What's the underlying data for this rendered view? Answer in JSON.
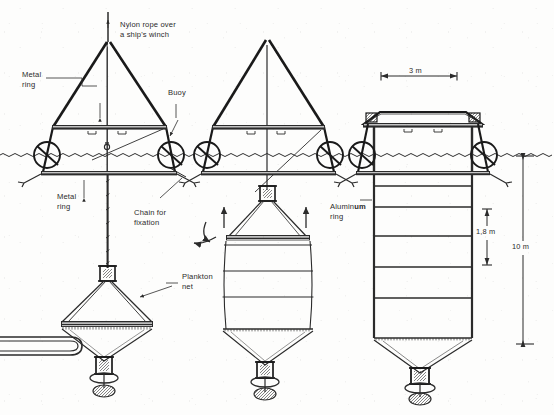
{
  "figure": {
    "type": "technical-line-diagram",
    "background_color": "#fdfdfc",
    "ink_color": "#1a1a1a",
    "panel_count": 3
  },
  "labels": {
    "nylon_rope": "Nylon rope over\na ship's winch",
    "metal_ring_top": "Metal\nring",
    "buoy": "Buoy",
    "metal_ring_lower": "Metal\nring",
    "chain_for_fixation": "Chain for\nfixation",
    "plankton_net": "Plankton\nnet",
    "aluminum_ring_pre": "Alumin",
    "aluminum_ring_bold": "um",
    "aluminum_ring_post": "\nring"
  },
  "dimensions": {
    "width_top": "3 m",
    "ring_spacing": "1,8 m",
    "total_depth": "10 m"
  },
  "panels": [
    {
      "id": "panel-left",
      "name": "lowering-stage",
      "description": "A-frame tripod with buoys at waterline, nylon rope lowering a collapsed plankton net with sampling hose"
    },
    {
      "id": "panel-middle",
      "name": "partially-deployed-stage",
      "description": "A-frame with net partially raised, aluminum rings spreading, arrows indicating upward hauling"
    },
    {
      "id": "panel-right",
      "name": "fully-deployed-stage",
      "description": "Fully extended cylindrical enclosure with stacked aluminum rings hanging to 10 m depth"
    }
  ],
  "icons": {
    "water_line": "wavy-waterline",
    "arrow_up": "arrow-up-icon",
    "arrow_curve": "curved-arrow-icon",
    "weight": "cod-end-weight"
  }
}
